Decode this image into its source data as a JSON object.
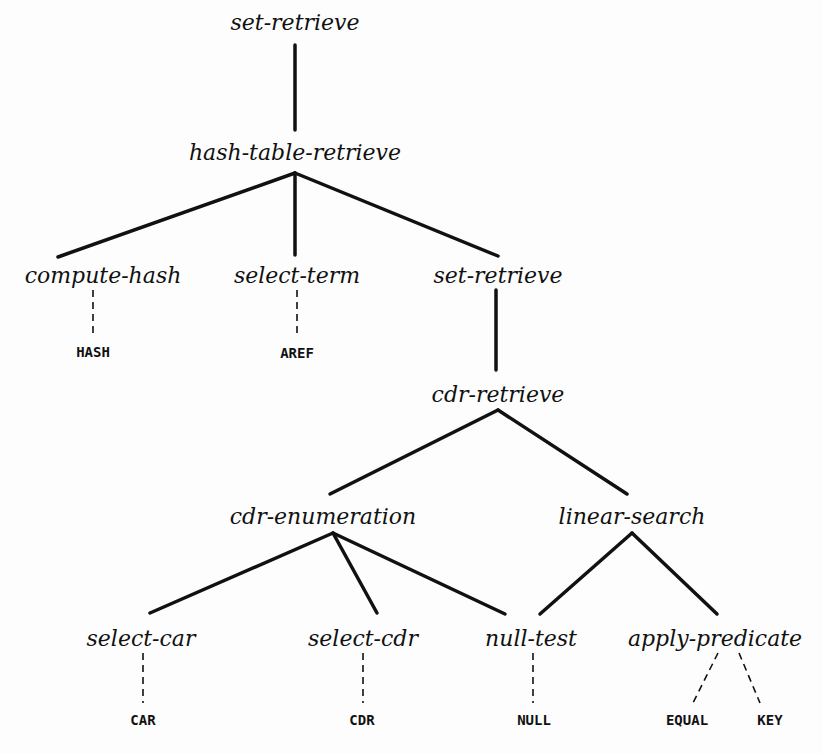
{
  "diagram": {
    "type": "tree",
    "nodes": [
      {
        "id": "n1",
        "label": "set-retrieve",
        "x": 295,
        "y": 22,
        "kind": "op"
      },
      {
        "id": "n2",
        "label": "hash-table-retrieve",
        "x": 295,
        "y": 152,
        "kind": "op"
      },
      {
        "id": "n3",
        "label": "compute-hash",
        "x": 103,
        "y": 275,
        "kind": "op"
      },
      {
        "id": "n4",
        "label": "select-term",
        "x": 297,
        "y": 275,
        "kind": "op"
      },
      {
        "id": "n5",
        "label": "set-retrieve",
        "x": 498,
        "y": 275,
        "kind": "op"
      },
      {
        "id": "n6",
        "label": "HASH",
        "x": 93,
        "y": 352,
        "kind": "code"
      },
      {
        "id": "n7",
        "label": "AREF",
        "x": 297,
        "y": 353,
        "kind": "code"
      },
      {
        "id": "n8",
        "label": "cdr-retrieve",
        "x": 498,
        "y": 394,
        "kind": "op"
      },
      {
        "id": "n9",
        "label": "cdr-enumeration",
        "x": 323,
        "y": 516,
        "kind": "op"
      },
      {
        "id": "n10",
        "label": "linear-search",
        "x": 632,
        "y": 516,
        "kind": "op"
      },
      {
        "id": "n11",
        "label": "select-car",
        "x": 141,
        "y": 638,
        "kind": "op"
      },
      {
        "id": "n12",
        "label": "select-cdr",
        "x": 363,
        "y": 638,
        "kind": "op"
      },
      {
        "id": "n13",
        "label": "null-test",
        "x": 531,
        "y": 638,
        "kind": "op"
      },
      {
        "id": "n14",
        "label": "apply-predicate",
        "x": 715,
        "y": 638,
        "kind": "op"
      },
      {
        "id": "n15",
        "label": "CAR",
        "x": 143,
        "y": 720,
        "kind": "code"
      },
      {
        "id": "n16",
        "label": "CDR",
        "x": 362,
        "y": 720,
        "kind": "code"
      },
      {
        "id": "n17",
        "label": "NULL",
        "x": 534,
        "y": 720,
        "kind": "code"
      },
      {
        "id": "n18",
        "label": "EQUAL",
        "x": 687,
        "y": 720,
        "kind": "code"
      },
      {
        "id": "n19",
        "label": "KEY",
        "x": 770,
        "y": 720,
        "kind": "code"
      }
    ],
    "edges": [
      {
        "from": "n1",
        "to": "n2",
        "style": "solid",
        "x1": 295,
        "y1": 45,
        "x2": 295,
        "y2": 130
      },
      {
        "from": "n2",
        "to": "n3",
        "style": "solid",
        "x1": 295,
        "y1": 173,
        "x2": 58,
        "y2": 257
      },
      {
        "from": "n2",
        "to": "n4",
        "style": "solid",
        "x1": 295,
        "y1": 173,
        "x2": 295,
        "y2": 255
      },
      {
        "from": "n2",
        "to": "n5",
        "style": "solid",
        "x1": 295,
        "y1": 173,
        "x2": 498,
        "y2": 256
      },
      {
        "from": "n3",
        "to": "n6",
        "style": "dashed",
        "x1": 93,
        "y1": 290,
        "x2": 93,
        "y2": 338
      },
      {
        "from": "n4",
        "to": "n7",
        "style": "dashed",
        "x1": 297,
        "y1": 290,
        "x2": 297,
        "y2": 338
      },
      {
        "from": "n5",
        "to": "n8",
        "style": "solid",
        "x1": 496,
        "y1": 290,
        "x2": 496,
        "y2": 370
      },
      {
        "from": "n8",
        "to": "n9",
        "style": "solid",
        "x1": 498,
        "y1": 410,
        "x2": 330,
        "y2": 494
      },
      {
        "from": "n8",
        "to": "n10",
        "style": "solid",
        "x1": 498,
        "y1": 410,
        "x2": 627,
        "y2": 494
      },
      {
        "from": "n9",
        "to": "n11",
        "style": "solid",
        "x1": 333,
        "y1": 533,
        "x2": 150,
        "y2": 613
      },
      {
        "from": "n9",
        "to": "n12",
        "style": "solid",
        "x1": 333,
        "y1": 533,
        "x2": 377,
        "y2": 613
      },
      {
        "from": "n9",
        "to": "n13",
        "style": "solid",
        "x1": 333,
        "y1": 533,
        "x2": 505,
        "y2": 614
      },
      {
        "from": "n10",
        "to": "n13",
        "style": "solid",
        "x1": 632,
        "y1": 533,
        "x2": 540,
        "y2": 614
      },
      {
        "from": "n10",
        "to": "n14",
        "style": "solid",
        "x1": 632,
        "y1": 533,
        "x2": 717,
        "y2": 614
      },
      {
        "from": "n11",
        "to": "n15",
        "style": "dashed",
        "x1": 143,
        "y1": 653,
        "x2": 143,
        "y2": 703
      },
      {
        "from": "n12",
        "to": "n16",
        "style": "dashed",
        "x1": 363,
        "y1": 653,
        "x2": 363,
        "y2": 703
      },
      {
        "from": "n13",
        "to": "n17",
        "style": "dashed",
        "x1": 533,
        "y1": 653,
        "x2": 533,
        "y2": 703
      },
      {
        "from": "n14",
        "to": "n18",
        "style": "dashed",
        "x1": 718,
        "y1": 653,
        "x2": 693,
        "y2": 703
      },
      {
        "from": "n14",
        "to": "n19",
        "style": "dashed",
        "x1": 739,
        "y1": 653,
        "x2": 760,
        "y2": 703
      }
    ],
    "colors": {
      "line": "#111111",
      "text": "#111111",
      "background": "#fdfdfd"
    }
  }
}
